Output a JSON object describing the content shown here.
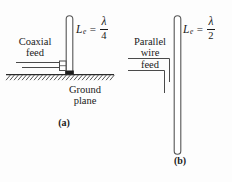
{
  "figure": {
    "type": "antenna-diagram",
    "width": 232,
    "height": 182,
    "line_color": "#4a4a4a",
    "text_color": "#1a1a1a",
    "background": "#fdfdfd"
  },
  "panel_a": {
    "caption": "(a)",
    "feed_label": "Coaxial\nfeed",
    "feed_label_line1": "Coaxial",
    "feed_label_line2": "feed",
    "ground_label_line1": "Ground",
    "ground_label_line2": "plane",
    "equation": {
      "variable": "L",
      "subscript": "e",
      "relation": "=",
      "numerator": "λ",
      "denominator": "4",
      "full": "L_e = λ/4"
    },
    "elements": {
      "antenna": "quarter-wave-monopole",
      "feed": "coaxial-feed-line",
      "connector": "coax-connector",
      "base": "feed-point",
      "ground": "hatched-ground-plane"
    }
  },
  "panel_b": {
    "caption": "(b)",
    "feed_label_line1": "Parallel",
    "feed_label_line2": "wire",
    "feed_label_line3": "feed",
    "equation": {
      "variable": "L",
      "subscript": "e",
      "relation": "=",
      "numerator": "λ",
      "denominator": "2",
      "full": "L_e = λ/2"
    },
    "elements": {
      "antenna": "half-wave-dipole",
      "feed": "parallel-wire-feed-line"
    }
  }
}
